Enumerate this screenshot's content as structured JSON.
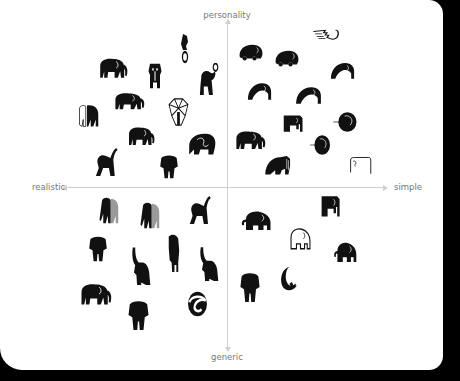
{
  "axes": {
    "top": "personality",
    "bottom": "generic",
    "left": "realistic",
    "right": "simple"
  },
  "colors": {
    "background": "#000000",
    "card": "#ffffff",
    "axis": "#cfcfcf",
    "label": "#777777",
    "logo": "#111111"
  },
  "logos": [
    {
      "quadrant": "realistic-personality",
      "kind": "walking-elephant",
      "x": 97,
      "y": 55,
      "w": 32,
      "h": 26
    },
    {
      "quadrant": "realistic-personality",
      "kind": "standing-cartoon-elephant",
      "x": 145,
      "y": 60,
      "w": 20,
      "h": 30
    },
    {
      "quadrant": "realistic-personality",
      "kind": "circus-elephant-on-ring",
      "x": 175,
      "y": 32,
      "w": 20,
      "h": 32
    },
    {
      "quadrant": "realistic-personality",
      "kind": "circus-elephant-with-ball",
      "x": 196,
      "y": 63,
      "w": 26,
      "h": 34
    },
    {
      "quadrant": "realistic-personality",
      "kind": "walking-elephant",
      "x": 112,
      "y": 90,
      "w": 34,
      "h": 22
    },
    {
      "quadrant": "realistic-personality",
      "kind": "geometric-elephant-outline",
      "x": 165,
      "y": 97,
      "w": 27,
      "h": 30
    },
    {
      "quadrant": "realistic-personality",
      "kind": "black-white-elephant-pair",
      "x": 77,
      "y": 102,
      "w": 25,
      "h": 28
    },
    {
      "quadrant": "realistic-personality",
      "kind": "walking-elephant",
      "x": 126,
      "y": 124,
      "w": 30,
      "h": 24
    },
    {
      "quadrant": "realistic-personality",
      "kind": "curled-elephant",
      "x": 186,
      "y": 130,
      "w": 32,
      "h": 26
    },
    {
      "quadrant": "realistic-personality",
      "kind": "trumpeting-elephant",
      "x": 93,
      "y": 146,
      "w": 29,
      "h": 32
    },
    {
      "quadrant": "realistic-personality",
      "kind": "front-view-elephant",
      "x": 158,
      "y": 153,
      "w": 22,
      "h": 27
    },
    {
      "quadrant": "simple-personality",
      "kind": "winged-trunk-outline",
      "x": 310,
      "y": 28,
      "w": 34,
      "h": 19
    },
    {
      "quadrant": "simple-personality",
      "kind": "round-car-elephant",
      "x": 237,
      "y": 42,
      "w": 28,
      "h": 22
    },
    {
      "quadrant": "simple-personality",
      "kind": "round-car-elephant",
      "x": 273,
      "y": 48,
      "w": 28,
      "h": 22
    },
    {
      "quadrant": "simple-personality",
      "kind": "arched-elephant",
      "x": 328,
      "y": 59,
      "w": 29,
      "h": 21
    },
    {
      "quadrant": "simple-personality",
      "kind": "arched-elephant",
      "x": 245,
      "y": 79,
      "w": 29,
      "h": 22
    },
    {
      "quadrant": "simple-personality",
      "kind": "arched-elephant",
      "x": 293,
      "y": 83,
      "w": 31,
      "h": 22
    },
    {
      "quadrant": "simple-personality",
      "kind": "square-elephant",
      "x": 280,
      "y": 113,
      "w": 25,
      "h": 20
    },
    {
      "quadrant": "simple-personality",
      "kind": "circle-elephant",
      "x": 332,
      "y": 110,
      "w": 28,
      "h": 24
    },
    {
      "quadrant": "simple-personality",
      "kind": "walking-elephant",
      "x": 233,
      "y": 128,
      "w": 34,
      "h": 24
    },
    {
      "quadrant": "simple-personality",
      "kind": "circle-elephant",
      "x": 309,
      "y": 133,
      "w": 24,
      "h": 24
    },
    {
      "quadrant": "simple-personality",
      "kind": "mammoth",
      "x": 262,
      "y": 153,
      "w": 33,
      "h": 23
    },
    {
      "quadrant": "simple-personality",
      "kind": "line-elephant-outline",
      "x": 348,
      "y": 155,
      "w": 26,
      "h": 20
    },
    {
      "quadrant": "realistic-generic",
      "kind": "realistic-pair-elephant",
      "x": 97,
      "y": 195,
      "w": 25,
      "h": 30
    },
    {
      "quadrant": "realistic-generic",
      "kind": "realistic-pair-elephant",
      "x": 138,
      "y": 200,
      "w": 25,
      "h": 30
    },
    {
      "quadrant": "realistic-generic",
      "kind": "trumpeting-elephant",
      "x": 187,
      "y": 194,
      "w": 28,
      "h": 32
    },
    {
      "quadrant": "realistic-generic",
      "kind": "front-view-elephant",
      "x": 87,
      "y": 234,
      "w": 22,
      "h": 29
    },
    {
      "quadrant": "realistic-generic",
      "kind": "rearing-elephant",
      "x": 128,
      "y": 245,
      "w": 24,
      "h": 40
    },
    {
      "quadrant": "realistic-generic",
      "kind": "standing-elephant-tall",
      "x": 164,
      "y": 234,
      "w": 19,
      "h": 38
    },
    {
      "quadrant": "realistic-generic",
      "kind": "rearing-elephant",
      "x": 196,
      "y": 245,
      "w": 24,
      "h": 36
    },
    {
      "quadrant": "realistic-generic",
      "kind": "walking-elephant",
      "x": 78,
      "y": 280,
      "w": 35,
      "h": 28
    },
    {
      "quadrant": "realistic-generic",
      "kind": "front-view-elephant",
      "x": 126,
      "y": 298,
      "w": 25,
      "h": 34
    },
    {
      "quadrant": "realistic-generic",
      "kind": "circle-swirl-elephant",
      "x": 184,
      "y": 290,
      "w": 27,
      "h": 28
    },
    {
      "quadrant": "simple-generic",
      "kind": "square-elephant",
      "x": 318,
      "y": 193,
      "w": 24,
      "h": 25
    },
    {
      "quadrant": "simple-generic",
      "kind": "rounded-elephant",
      "x": 239,
      "y": 209,
      "w": 35,
      "h": 24
    },
    {
      "quadrant": "simple-generic",
      "kind": "rounded-elephant-outline",
      "x": 287,
      "y": 226,
      "w": 27,
      "h": 26
    },
    {
      "quadrant": "simple-generic",
      "kind": "rounded-elephant",
      "x": 332,
      "y": 240,
      "w": 27,
      "h": 25
    },
    {
      "quadrant": "simple-generic",
      "kind": "front-view-elephant",
      "x": 238,
      "y": 270,
      "w": 24,
      "h": 34
    },
    {
      "quadrant": "simple-generic",
      "kind": "crescent-moon-elephant",
      "x": 277,
      "y": 265,
      "w": 25,
      "h": 27
    }
  ]
}
